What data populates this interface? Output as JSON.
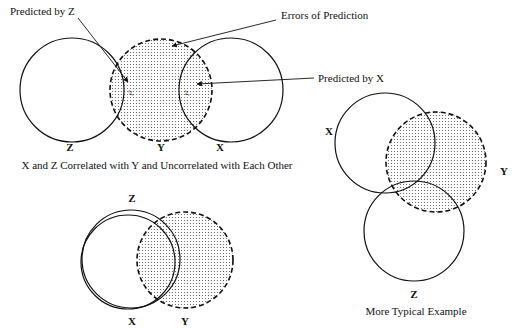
{
  "figure": {
    "top_diagram": {
      "circles": [
        {
          "label": "Z",
          "style": "solid"
        },
        {
          "label": "Y",
          "style": "dashed-shaded"
        },
        {
          "label": "X",
          "style": "solid"
        }
      ],
      "annotations": {
        "predicted_by_z": "Predicted  by Z",
        "errors_of_prediction": "Errors of Prediction",
        "predicted_by_x": "Predicted  by X"
      },
      "overlap_labels": {
        "zy": "r²",
        "xy": "r²"
      },
      "caption": "X and Z Correlated with Y and Uncorrelated with Each Other"
    },
    "bottom_left_diagram": {
      "labels": {
        "z": "Z",
        "x": "X",
        "y": "Y"
      }
    },
    "right_diagram": {
      "labels": {
        "x": "X",
        "y": "Y",
        "z": "Z"
      },
      "caption": "More Typical Example"
    }
  },
  "colors": {
    "stroke": "#111111",
    "shade_dot": "#555555",
    "background": "#ffffff"
  }
}
